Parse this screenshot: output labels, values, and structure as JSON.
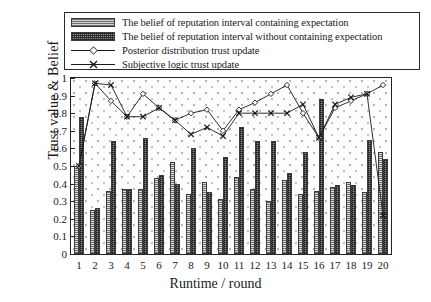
{
  "legend": {
    "items": [
      {
        "key": "swatch-light",
        "label": "The belief of reputation interval containing expectation"
      },
      {
        "key": "swatch-dark",
        "label": "The belief of reputation interval without containing expectation"
      },
      {
        "key": "line-diamond",
        "label": "Posterior distribution trust update"
      },
      {
        "key": "line-cross",
        "label": "Subjective logic trust update"
      }
    ]
  },
  "axes": {
    "ylabel": "Trust value & Belief",
    "xlabel": "Runtime / round",
    "yticks": [
      "0",
      "0.1",
      "0.2",
      "0.3",
      "0.4",
      "0.5",
      "0.6",
      "0.7",
      "0.8",
      "0.9",
      "1"
    ],
    "xticks": [
      "1",
      "2",
      "3",
      "4",
      "5",
      "6",
      "7",
      "8",
      "9",
      "10",
      "11",
      "12",
      "13",
      "14",
      "15",
      "16",
      "17",
      "18",
      "19",
      "20"
    ]
  },
  "colors": {
    "axis": "#242424",
    "bar_light": "#dcdcdc",
    "bar_dark": "#9a9a9a",
    "line": "#1a1a1a",
    "panel_bg": "#fdfdfd"
  },
  "chart_data": {
    "type": "bar",
    "title": "",
    "xlabel": "Runtime / round",
    "ylabel": "Trust value & Belief",
    "ylim": [
      0,
      1
    ],
    "xlim": [
      0.5,
      20.5
    ],
    "grid": false,
    "legend_position": "top",
    "categories": [
      "1",
      "2",
      "3",
      "4",
      "5",
      "6",
      "7",
      "8",
      "9",
      "10",
      "11",
      "12",
      "13",
      "14",
      "15",
      "16",
      "17",
      "18",
      "19",
      "20"
    ],
    "series": [
      {
        "name": "The belief of reputation interval containing expectation",
        "type": "bar",
        "values": [
          0.5,
          0.25,
          0.36,
          0.37,
          0.37,
          0.43,
          0.52,
          0.34,
          0.41,
          0.31,
          0.44,
          0.37,
          0.3,
          0.42,
          0.34,
          0.36,
          0.38,
          0.41,
          0.35,
          0.58
        ]
      },
      {
        "name": "The belief of reputation interval without containing expectation",
        "type": "bar",
        "values": [
          0.78,
          0.26,
          0.64,
          0.37,
          0.66,
          0.45,
          0.4,
          0.6,
          0.35,
          0.55,
          0.72,
          0.64,
          0.64,
          0.46,
          0.58,
          0.88,
          0.39,
          0.39,
          0.65,
          0.54
        ]
      },
      {
        "name": "Posterior distribution trust update",
        "type": "line",
        "marker": "diamond",
        "values": [
          0.5,
          0.97,
          0.87,
          0.78,
          0.91,
          0.83,
          0.76,
          0.8,
          0.82,
          0.7,
          0.82,
          0.86,
          0.91,
          0.96,
          0.8,
          0.66,
          0.83,
          0.87,
          0.91,
          0.96
        ]
      },
      {
        "name": "Subjective logic trust update",
        "type": "line",
        "marker": "cross",
        "values": [
          0.5,
          0.97,
          0.96,
          0.78,
          0.78,
          0.83,
          0.76,
          0.68,
          0.72,
          0.67,
          0.8,
          0.8,
          0.8,
          0.8,
          0.85,
          0.66,
          0.85,
          0.89,
          0.91,
          0.22
        ]
      }
    ]
  }
}
